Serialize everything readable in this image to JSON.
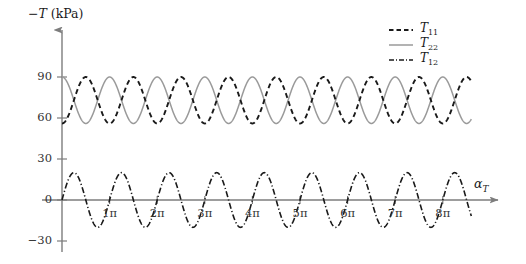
{
  "chart_data": {
    "type": "line",
    "title": "",
    "ylabel": "−T (kPa)",
    "ylabel_symbol": "T",
    "ylabel_unit": "(kPa)",
    "ylabel_sign": "−",
    "xlabel": "α_T",
    "xlabel_symbol": "α",
    "xlabel_sub": "T",
    "x_unit": "pi",
    "xlim": [
      0,
      8.6
    ],
    "ylim": [
      -30,
      100
    ],
    "yticks": [
      90,
      60,
      30,
      0,
      -30
    ],
    "ytick_labels": [
      "90",
      "60",
      "30",
      "0",
      "−30"
    ],
    "xticks": [
      1,
      2,
      3,
      4,
      5,
      6,
      7,
      8
    ],
    "xtick_labels": [
      "1π",
      "2π",
      "3π",
      "4π",
      "5π",
      "6π",
      "7π",
      "8π"
    ],
    "grid": false,
    "legend_position": "top-right",
    "axis_style": "arrow-spine",
    "series": [
      {
        "name": "T11",
        "label": "T",
        "sub": "11",
        "style": "dashed",
        "color": "#1a1a1a",
        "width": 1.9,
        "mean": 73,
        "amplitude": 17,
        "period_pi": 1.0,
        "phase": "trough-shifted",
        "start_value": 50,
        "min": 56,
        "max": 90
      },
      {
        "name": "T22",
        "label": "T",
        "sub": "22",
        "style": "solid",
        "color": "#9a9a9a",
        "width": 1.5,
        "mean": 73,
        "amplitude": 17,
        "period_pi": 1.0,
        "phase": "peak-at-zero",
        "start_value": 90,
        "min": 56,
        "max": 90
      },
      {
        "name": "T12",
        "label": "T",
        "sub": "12",
        "style": "dashdot",
        "color": "#1a1a1a",
        "width": 1.6,
        "mean": 0,
        "amplitude": 20,
        "period_pi": 1.0,
        "phase": "zero-rising",
        "start_value": 0,
        "min": -20,
        "max": 20
      }
    ]
  },
  "legend": {
    "items": [
      {
        "label": "T",
        "sub": "11"
      },
      {
        "label": "T",
        "sub": "22"
      },
      {
        "label": "T",
        "sub": "12"
      }
    ]
  },
  "axes": {
    "y_title_sign": "−",
    "y_title_symbol": "T",
    "y_title_unit": "(kPa)",
    "x_title_symbol": "α",
    "x_title_sub": "T"
  }
}
